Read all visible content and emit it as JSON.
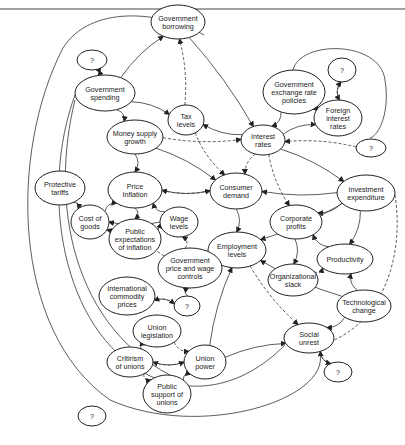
{
  "diagram": {
    "type": "causal-loop-diagram",
    "top_rule": true,
    "legend": {
      "solid_arrow": "direct influence",
      "dashed_arrow": "indirect/uncertain influence"
    },
    "nodes": [
      {
        "id": "q1",
        "lines": [
          "?"
        ],
        "x": 92,
        "y": 60,
        "rx": 15,
        "ry": 10
      },
      {
        "id": "gov_borrowing",
        "lines": [
          "Government",
          "borrowing"
        ],
        "x": 178,
        "y": 22,
        "rx": 27,
        "ry": 17
      },
      {
        "id": "gov_exchange",
        "lines": [
          "Government",
          "exchange rate",
          "policies"
        ],
        "x": 294,
        "y": 92,
        "rx": 31,
        "ry": 22
      },
      {
        "id": "q2",
        "lines": [
          "?"
        ],
        "x": 342,
        "y": 70,
        "rx": 14,
        "ry": 12
      },
      {
        "id": "gov_spending",
        "lines": [
          "Government",
          "spending"
        ],
        "x": 105,
        "y": 93,
        "rx": 30,
        "ry": 18
      },
      {
        "id": "tax_levels",
        "lines": [
          "Tax",
          "levels"
        ],
        "x": 186,
        "y": 120,
        "rx": 18,
        "ry": 15
      },
      {
        "id": "foreign_rates",
        "lines": [
          "Foreign",
          "interest",
          "rates"
        ],
        "x": 338,
        "y": 118,
        "rx": 24,
        "ry": 18
      },
      {
        "id": "interest_rates",
        "lines": [
          "Interest",
          "rates"
        ],
        "x": 263,
        "y": 140,
        "rx": 22,
        "ry": 15
      },
      {
        "id": "q3",
        "lines": [
          "?"
        ],
        "x": 371,
        "y": 148,
        "rx": 15,
        "ry": 9
      },
      {
        "id": "money_supply",
        "lines": [
          "Money supply",
          "growth"
        ],
        "x": 135,
        "y": 137,
        "rx": 28,
        "ry": 17
      },
      {
        "id": "price_inflation",
        "lines": [
          "Price",
          "Inflation"
        ],
        "x": 135,
        "y": 190,
        "rx": 27,
        "ry": 18
      },
      {
        "id": "consumer_demand",
        "lines": [
          "Consumer",
          "demand"
        ],
        "x": 236,
        "y": 191,
        "rx": 26,
        "ry": 18
      },
      {
        "id": "investment",
        "lines": [
          "Investment",
          "expenditure"
        ],
        "x": 366,
        "y": 193,
        "rx": 29,
        "ry": 18
      },
      {
        "id": "protective_tariffs",
        "lines": [
          "Protective",
          "tariffs"
        ],
        "x": 60,
        "y": 188,
        "rx": 25,
        "ry": 17
      },
      {
        "id": "cost_of_goods",
        "lines": [
          "Cost of",
          "goods"
        ],
        "x": 90,
        "y": 222,
        "rx": 19,
        "ry": 17
      },
      {
        "id": "wage_levels",
        "lines": [
          "Wage",
          "levels"
        ],
        "x": 179,
        "y": 222,
        "rx": 19,
        "ry": 15
      },
      {
        "id": "public_expectations",
        "lines": [
          "Public",
          "expectations",
          "of inflation"
        ],
        "x": 135,
        "y": 239,
        "rx": 26,
        "ry": 20
      },
      {
        "id": "corporate_profits",
        "lines": [
          "Corporate",
          "profits"
        ],
        "x": 296,
        "y": 222,
        "rx": 26,
        "ry": 17
      },
      {
        "id": "employment",
        "lines": [
          "Employment",
          "levels"
        ],
        "x": 237,
        "y": 250,
        "rx": 29,
        "ry": 18
      },
      {
        "id": "productivity",
        "lines": [
          "Productivity"
        ],
        "x": 345,
        "y": 259,
        "rx": 28,
        "ry": 15
      },
      {
        "id": "gov_price_wage",
        "lines": [
          "Government",
          "price and wage",
          "controls"
        ],
        "x": 190,
        "y": 268,
        "rx": 32,
        "ry": 20
      },
      {
        "id": "org_slack",
        "lines": [
          "Organizational",
          "slack"
        ],
        "x": 293,
        "y": 280,
        "rx": 25,
        "ry": 16
      },
      {
        "id": "intl_commodity",
        "lines": [
          "International",
          "commodity",
          "prices"
        ],
        "x": 127,
        "y": 296,
        "rx": 28,
        "ry": 19
      },
      {
        "id": "q4",
        "lines": [
          "?"
        ],
        "x": 187,
        "y": 306,
        "rx": 13,
        "ry": 10
      },
      {
        "id": "tech_change",
        "lines": [
          "Technological",
          "change"
        ],
        "x": 364,
        "y": 306,
        "rx": 27,
        "ry": 16
      },
      {
        "id": "social_unrest",
        "lines": [
          "Social",
          "unrest"
        ],
        "x": 309,
        "y": 338,
        "rx": 25,
        "ry": 15
      },
      {
        "id": "union_legislation",
        "lines": [
          "Union",
          "legislation"
        ],
        "x": 157,
        "y": 331,
        "rx": 24,
        "ry": 16
      },
      {
        "id": "criticism_unions",
        "lines": [
          "Critirism",
          "of unions"
        ],
        "x": 130,
        "y": 362,
        "rx": 23,
        "ry": 15
      },
      {
        "id": "union_power",
        "lines": [
          "Union",
          "power"
        ],
        "x": 205,
        "y": 362,
        "rx": 21,
        "ry": 17
      },
      {
        "id": "q5",
        "lines": [
          "?"
        ],
        "x": 338,
        "y": 372,
        "rx": 14,
        "ry": 10
      },
      {
        "id": "public_support",
        "lines": [
          "Public",
          "support of",
          "unions"
        ],
        "x": 167,
        "y": 394,
        "rx": 24,
        "ry": 19
      },
      {
        "id": "q6",
        "lines": [
          "?"
        ],
        "x": 92,
        "y": 416,
        "rx": 14,
        "ry": 10
      }
    ],
    "edges": [
      {
        "from": "gov_spending",
        "to": "gov_borrowing",
        "style": "solid"
      },
      {
        "from": "gov_spending",
        "to": "tax_levels",
        "style": "solid"
      },
      {
        "from": "gov_spending",
        "to": "money_supply",
        "style": "solid"
      },
      {
        "from": "q1",
        "to": "gov_spending",
        "style": "solid"
      },
      {
        "from": "gov_spending",
        "to": "q1",
        "style": "dashed"
      },
      {
        "from": "tax_levels",
        "to": "gov_borrowing",
        "style": "dashed"
      },
      {
        "from": "gov_borrowing",
        "to": "interest_rates",
        "style": "solid"
      },
      {
        "from": "interest_rates",
        "to": "tax_levels",
        "style": "solid"
      },
      {
        "from": "tax_levels",
        "to": "consumer_demand",
        "style": "dashed"
      },
      {
        "from": "gov_exchange",
        "to": "interest_rates",
        "style": "solid"
      },
      {
        "from": "foreign_rates",
        "to": "gov_exchange",
        "style": "solid"
      },
      {
        "from": "q2",
        "to": "foreign_rates",
        "style": "dashed"
      },
      {
        "from": "foreign_rates",
        "to": "q2",
        "style": "solid"
      },
      {
        "from": "interest_rates",
        "to": "foreign_rates",
        "style": "solid"
      },
      {
        "from": "money_supply",
        "to": "interest_rates",
        "style": "dashed"
      },
      {
        "from": "money_supply",
        "to": "price_inflation",
        "style": "solid"
      },
      {
        "from": "money_supply",
        "to": "consumer_demand",
        "style": "solid"
      },
      {
        "from": "interest_rates",
        "to": "consumer_demand",
        "style": "dashed"
      },
      {
        "from": "interest_rates",
        "to": "corporate_profits",
        "style": "dashed"
      },
      {
        "from": "interest_rates",
        "to": "investment",
        "style": "solid"
      },
      {
        "from": "q3",
        "to": "interest_rates",
        "style": "dashed"
      },
      {
        "from": "consumer_demand",
        "to": "price_inflation",
        "style": "solid"
      },
      {
        "from": "price_inflation",
        "to": "consumer_demand",
        "style": "dashed"
      },
      {
        "from": "investment",
        "to": "consumer_demand",
        "style": "solid"
      },
      {
        "from": "investment",
        "to": "employment",
        "style": "solid"
      },
      {
        "from": "investment",
        "to": "corporate_profits",
        "style": "solid"
      },
      {
        "from": "investment",
        "to": "productivity",
        "style": "solid"
      },
      {
        "from": "protective_tariffs",
        "to": "cost_of_goods",
        "style": "solid"
      },
      {
        "from": "cost_of_goods",
        "to": "price_inflation",
        "style": "solid"
      },
      {
        "from": "price_inflation",
        "to": "public_expectations",
        "style": "solid"
      },
      {
        "from": "wage_levels",
        "to": "price_inflation",
        "style": "solid"
      },
      {
        "from": "wage_levels",
        "to": "cost_of_goods",
        "style": "solid"
      },
      {
        "from": "public_expectations",
        "to": "wage_levels",
        "style": "solid"
      },
      {
        "from": "consumer_demand",
        "to": "employment",
        "style": "solid"
      },
      {
        "from": "corporate_profits",
        "to": "org_slack",
        "style": "solid"
      },
      {
        "from": "productivity",
        "to": "corporate_profits",
        "style": "solid"
      },
      {
        "from": "org_slack",
        "to": "productivity",
        "style": "dashed"
      },
      {
        "from": "tech_change",
        "to": "productivity",
        "style": "solid"
      },
      {
        "from": "tech_change",
        "to": "employment",
        "style": "solid"
      },
      {
        "from": "employment",
        "to": "social_unrest",
        "style": "dashed"
      },
      {
        "from": "gov_price_wage",
        "to": "wage_levels",
        "style": "dashed"
      },
      {
        "from": "gov_price_wage",
        "to": "cost_of_goods",
        "style": "dashed"
      },
      {
        "from": "q4",
        "to": "gov_price_wage",
        "style": "solid"
      },
      {
        "from": "intl_commodity",
        "to": "q4",
        "style": "solid"
      },
      {
        "from": "q4",
        "to": "intl_commodity",
        "style": "dashed"
      },
      {
        "from": "criticism_unions",
        "to": "union_legislation",
        "style": "solid"
      },
      {
        "from": "union_legislation",
        "to": "union_power",
        "style": "dashed"
      },
      {
        "from": "union_power",
        "to": "criticism_unions",
        "style": "solid"
      },
      {
        "from": "criticism_unions",
        "to": "union_power",
        "style": "dashed"
      },
      {
        "from": "criticism_unions",
        "to": "public_support",
        "style": "dashed"
      },
      {
        "from": "public_support",
        "to": "union_power",
        "style": "solid"
      },
      {
        "from": "union_power",
        "to": "social_unrest",
        "style": "solid"
      },
      {
        "from": "union_power",
        "to": "employment",
        "style": "solid"
      },
      {
        "from": "social_unrest",
        "to": "q5",
        "style": "dashed"
      },
      {
        "from": "q5",
        "to": "social_unrest",
        "style": "solid"
      },
      {
        "from": "tech_change",
        "to": "social_unrest",
        "style": "solid"
      }
    ]
  }
}
